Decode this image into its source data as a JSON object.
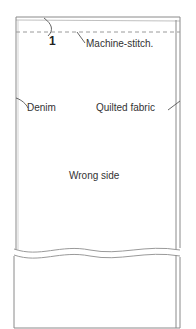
{
  "diagram": {
    "step_number": "1",
    "labels": {
      "stitch": "Machine-stitch.",
      "left_layer": "Denim",
      "right_layer": "Quilted fabric",
      "center": "Wrong side"
    },
    "colors": {
      "line": "#8a8a8a",
      "stitch": "#9a9a9a",
      "text": "#333333",
      "background": "#ffffff"
    }
  }
}
